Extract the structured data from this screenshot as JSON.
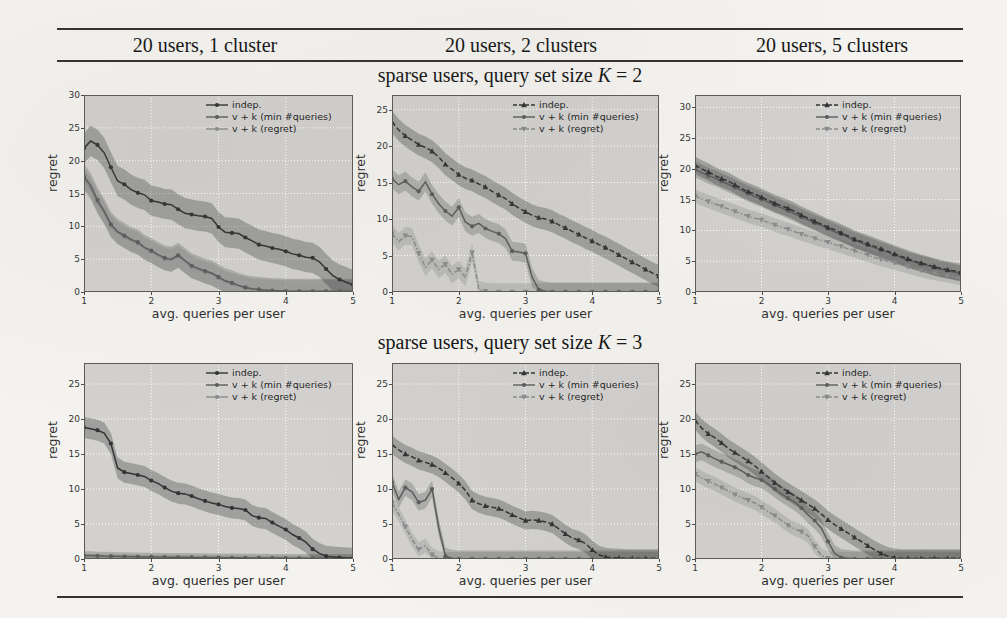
{
  "table": {
    "col_headers": [
      "20 users, 1 cluster",
      "20 users, 2 clusters",
      "20 users, 5 clusters"
    ],
    "row_titles": [
      "sparse users, query set size K = 2",
      "sparse users, query set size K = 3"
    ]
  },
  "axis": {
    "xlabel": "avg. queries per user",
    "ylabel": "regret",
    "xticks": [
      1,
      2,
      3,
      4,
      5
    ],
    "xlim": [
      1,
      5
    ]
  },
  "legend_labels": [
    "indep.",
    "v + k (min #queries)",
    "v + k (regret)"
  ],
  "colors": {
    "page_bg": "#f4f3ef",
    "rule": "#33322f",
    "plot_bg": "#d2d1cf",
    "grid": "#ffffff",
    "spine": "#5c5b58",
    "indep": "#343434",
    "vk_min": "#5c5c5c",
    "vk_regret": "#8a8a8a",
    "band_opacity": 0.32
  },
  "chart_data": [
    {
      "type": "line",
      "col_header": "20 users, 1 cluster",
      "row_title": "sparse users, query set size K = 2",
      "xlabel": "avg. queries per user",
      "ylabel": "regret",
      "x_start": 1,
      "x_step": 0.1,
      "xlim": [
        1,
        5
      ],
      "ylim": [
        0,
        30
      ],
      "yticks": [
        0,
        5,
        10,
        15,
        20,
        25,
        30
      ],
      "legend_pos": "upper-right",
      "grid": true,
      "series": [
        {
          "name": "indep.",
          "key": "indep",
          "marker": "circle",
          "dash": "solid",
          "band": 2.3,
          "y": [
            21.9,
            23.0,
            22.4,
            21.2,
            19.0,
            16.9,
            16.4,
            15.6,
            15.1,
            14.8,
            13.9,
            13.7,
            13.4,
            13.3,
            12.6,
            12.0,
            11.8,
            11.6,
            11.5,
            11.2,
            9.9,
            9.1,
            9.0,
            8.9,
            8.3,
            7.8,
            7.2,
            7.0,
            6.7,
            6.5,
            6.2,
            5.8,
            5.6,
            5.3,
            5.2,
            4.6,
            3.5,
            2.5,
            1.9,
            1.5,
            1.1
          ]
        },
        {
          "name": "v + k (min #queries)",
          "key": "vk_min",
          "marker": "circle",
          "dash": "solid",
          "band": 1.9,
          "y": [
            17.6,
            16.2,
            14.0,
            12.3,
            10.3,
            9.2,
            8.6,
            8.0,
            7.6,
            6.8,
            6.3,
            5.7,
            5.2,
            5.0,
            5.6,
            4.8,
            4.0,
            3.6,
            3.2,
            2.9,
            2.3,
            1.7,
            1.4,
            1.0,
            0.7,
            0.5,
            0.4,
            0.3,
            0.2,
            0.2,
            0.1,
            0.1,
            0.1,
            0.1,
            0.1,
            0.1,
            0.1,
            0.1,
            0.1,
            0.1,
            0.1
          ]
        },
        {
          "name": "v + k (regret)",
          "key": "vk_regret",
          "marker": "circle",
          "dash": "solid",
          "band": 1.7,
          "y": [
            17.1,
            15.7,
            13.6,
            12.0,
            10.0,
            9.0,
            8.4,
            7.8,
            7.4,
            6.6,
            6.1,
            5.5,
            5.0,
            4.8,
            5.4,
            4.6,
            3.8,
            3.4,
            3.0,
            2.7,
            2.1,
            1.5,
            1.2,
            0.9,
            0.6,
            0.4,
            0.3,
            0.2,
            0.2,
            0.1,
            0.1,
            0.1,
            0.1,
            0.1,
            0.1,
            0.1,
            0.1,
            0.1,
            0.1,
            0.1,
            0.1
          ]
        }
      ]
    },
    {
      "type": "line",
      "col_header": "20 users, 2 clusters",
      "row_title": "sparse users, query set size K = 2",
      "xlabel": "avg. queries per user",
      "ylabel": "regret",
      "x_start": 1,
      "x_step": 0.1,
      "xlim": [
        1,
        5
      ],
      "ylim": [
        0,
        27
      ],
      "yticks": [
        0,
        5,
        10,
        15,
        20,
        25
      ],
      "legend_pos": "upper-right",
      "grid": true,
      "series": [
        {
          "name": "indep.",
          "key": "indep",
          "marker": "triangle",
          "dash": "dashed",
          "band": 1.5,
          "y": [
            23.3,
            22.2,
            21.4,
            20.8,
            20.2,
            19.8,
            19.3,
            18.5,
            17.5,
            16.8,
            16.1,
            15.6,
            15.3,
            14.8,
            14.4,
            13.8,
            13.3,
            12.8,
            12.1,
            11.5,
            11.0,
            10.5,
            10.2,
            10.0,
            9.7,
            9.2,
            8.8,
            8.3,
            7.9,
            7.4,
            7.0,
            6.5,
            6.1,
            5.6,
            5.1,
            4.6,
            4.1,
            3.6,
            3.1,
            2.6,
            2.2
          ]
        },
        {
          "name": "v + k (min #queries)",
          "key": "vk_min",
          "marker": "circle",
          "dash": "solid",
          "band": 1.3,
          "y": [
            15.5,
            14.7,
            15.2,
            14.4,
            13.8,
            15.1,
            13.4,
            12.1,
            11.1,
            10.4,
            11.6,
            9.6,
            9.0,
            9.4,
            8.7,
            8.3,
            8.0,
            7.3,
            5.6,
            5.5,
            5.3,
            2.0,
            0.3,
            0.1,
            0,
            0,
            0,
            0,
            0,
            0,
            0,
            0,
            0,
            0,
            0,
            0,
            0,
            0,
            0,
            0,
            0
          ]
        },
        {
          "name": "v + k (regret)",
          "key": "vk_regret",
          "marker": "triangle-down",
          "dash": "dashdot",
          "band": 1.2,
          "y": [
            8.0,
            6.9,
            7.7,
            7.6,
            5.3,
            3.4,
            4.4,
            3.1,
            3.8,
            2.4,
            3.1,
            2.0,
            5.4,
            0.3,
            0.1,
            0,
            0,
            0,
            0,
            0,
            0,
            0,
            0,
            0,
            0,
            0,
            0,
            0,
            0,
            0,
            0,
            0,
            0,
            0,
            0,
            0,
            0,
            0,
            0,
            0,
            0
          ]
        }
      ]
    },
    {
      "type": "line",
      "col_header": "20 users, 5 clusters",
      "row_title": "sparse users, query set size K = 2",
      "xlabel": "avg. queries per user",
      "ylabel": "regret",
      "x_start": 1,
      "x_step": 0.1,
      "xlim": [
        1,
        5
      ],
      "ylim": [
        0,
        32
      ],
      "yticks": [
        0,
        5,
        10,
        15,
        20,
        25,
        30
      ],
      "legend_pos": "upper-right",
      "grid": true,
      "series": [
        {
          "name": "indep.",
          "key": "indep",
          "marker": "triangle",
          "dash": "dashed",
          "band": 1.4,
          "y": [
            20.6,
            20.0,
            19.5,
            18.9,
            18.4,
            18.0,
            17.4,
            16.8,
            16.3,
            15.9,
            15.4,
            14.9,
            14.4,
            14.0,
            13.6,
            13.1,
            12.5,
            12.0,
            11.5,
            11.0,
            10.5,
            10.1,
            9.6,
            9.1,
            8.6,
            8.2,
            7.8,
            7.4,
            7.0,
            6.6,
            6.2,
            5.8,
            5.4,
            5.0,
            4.7,
            4.4,
            4.1,
            3.8,
            3.6,
            3.4,
            3.2
          ]
        },
        {
          "name": "v + k (min #queries)",
          "key": "vk_min",
          "marker": "circle",
          "dash": "solid",
          "band": 1.3,
          "y": [
            19.9,
            19.4,
            18.9,
            18.5,
            18.0,
            17.5,
            17.0,
            16.5,
            16.0,
            15.5,
            15.1,
            14.6,
            14.1,
            13.7,
            13.2,
            12.7,
            12.2,
            11.7,
            11.2,
            10.8,
            10.3,
            9.8,
            9.4,
            8.9,
            8.4,
            8.0,
            7.6,
            7.2,
            6.8,
            6.4,
            6.0,
            5.6,
            5.2,
            4.9,
            4.6,
            4.3,
            4.0,
            3.7,
            3.5,
            3.2,
            3.0
          ]
        },
        {
          "name": "v + k (regret)",
          "key": "vk_regret",
          "marker": "triangle-down",
          "dash": "dashdot",
          "band": 1.1,
          "y": [
            15.6,
            15.1,
            14.7,
            14.3,
            13.9,
            13.5,
            13.1,
            12.7,
            12.3,
            12.0,
            11.7,
            11.3,
            10.9,
            10.5,
            10.2,
            9.8,
            9.4,
            9.1,
            8.7,
            8.4,
            8.1,
            7.7,
            7.4,
            7.0,
            6.7,
            6.3,
            6.0,
            5.6,
            5.3,
            5.0,
            4.7,
            4.4,
            4.1,
            3.8,
            3.5,
            3.2,
            3.0,
            2.8,
            2.6,
            2.4,
            2.2
          ]
        }
      ]
    },
    {
      "type": "line",
      "col_header": "20 users, 1 cluster",
      "row_title": "sparse users, query set size K = 3",
      "xlabel": "avg. queries per user",
      "ylabel": "regret",
      "x_start": 1,
      "x_step": 0.1,
      "xlim": [
        1,
        5
      ],
      "ylim": [
        0,
        28
      ],
      "yticks": [
        0,
        5,
        10,
        15,
        20,
        25
      ],
      "legend_pos": "upper-right",
      "grid": true,
      "series": [
        {
          "name": "indep.",
          "key": "indep",
          "marker": "circle",
          "dash": "solid",
          "band": 1.5,
          "y": [
            18.8,
            18.6,
            18.4,
            18.0,
            16.5,
            13.0,
            12.4,
            12.2,
            12.0,
            11.8,
            11.2,
            10.8,
            10.2,
            9.7,
            9.4,
            9.3,
            9.0,
            8.6,
            8.3,
            8.0,
            7.8,
            7.5,
            7.3,
            7.2,
            7.0,
            6.2,
            5.9,
            5.8,
            5.2,
            4.7,
            4.2,
            3.5,
            3.0,
            2.4,
            1.4,
            0.8,
            0.4,
            0.3,
            0.2,
            0.15,
            0.1
          ]
        },
        {
          "name": "v + k (min #queries)",
          "key": "vk_min",
          "marker": "circle",
          "dash": "solid",
          "band": 0.6,
          "y": [
            0.5,
            0.5,
            0.45,
            0.42,
            0.4,
            0.38,
            0.36,
            0.34,
            0.32,
            0.3,
            0.3,
            0.28,
            0.27,
            0.26,
            0.25,
            0.24,
            0.23,
            0.22,
            0.21,
            0.2,
            0.2,
            0.19,
            0.18,
            0.17,
            0.16,
            0.15,
            0.15,
            0.14,
            0.13,
            0.13,
            0.12,
            0.12,
            0.11,
            0.11,
            0.1,
            0.1,
            0.1,
            0.1,
            0.1,
            0.1,
            0.1
          ]
        },
        {
          "name": "v + k (regret)",
          "key": "vk_regret",
          "marker": "circle",
          "dash": "solid",
          "band": 0.4,
          "y": [
            0.3,
            0.3,
            0.28,
            0.27,
            0.26,
            0.25,
            0.24,
            0.23,
            0.22,
            0.21,
            0.2,
            0.2,
            0.19,
            0.18,
            0.17,
            0.16,
            0.15,
            0.15,
            0.14,
            0.13,
            0.13,
            0.12,
            0.12,
            0.11,
            0.11,
            0.1,
            0.1,
            0.1,
            0.09,
            0.09,
            0.08,
            0.08,
            0.08,
            0.07,
            0.07,
            0.07,
            0.06,
            0.06,
            0.06,
            0.05,
            0.05
          ]
        }
      ]
    },
    {
      "type": "line",
      "col_header": "20 users, 2 clusters",
      "row_title": "sparse users, query set size K = 3",
      "xlabel": "avg. queries per user",
      "ylabel": "regret",
      "x_start": 1,
      "x_step": 0.1,
      "xlim": [
        1,
        5
      ],
      "ylim": [
        0,
        28
      ],
      "yticks": [
        0,
        5,
        10,
        15,
        20,
        25
      ],
      "legend_pos": "upper-right",
      "grid": true,
      "series": [
        {
          "name": "indep.",
          "key": "indep",
          "marker": "triangle",
          "dash": "dashed",
          "band": 1.3,
          "y": [
            16.3,
            15.6,
            15.0,
            14.6,
            14.1,
            13.8,
            13.5,
            13.0,
            12.3,
            11.6,
            10.8,
            9.8,
            8.4,
            7.9,
            7.6,
            7.4,
            7.2,
            6.8,
            6.3,
            5.9,
            5.5,
            5.6,
            5.5,
            5.3,
            5.0,
            4.3,
            3.6,
            3.0,
            2.7,
            2.2,
            1.3,
            0.6,
            0.3,
            0.2,
            0.15,
            0.1,
            0.1,
            0.1,
            0.1,
            0.1,
            0.1
          ]
        },
        {
          "name": "v + k (min #queries)",
          "key": "vk_min",
          "marker": "circle",
          "dash": "solid",
          "band": 1.2,
          "y": [
            11.0,
            8.5,
            10.2,
            9.6,
            8.1,
            8.4,
            10.0,
            4.5,
            0.4,
            0.1,
            0,
            0,
            0,
            0,
            0,
            0,
            0,
            0,
            0,
            0,
            0,
            0,
            0,
            0,
            0,
            0,
            0,
            0,
            0,
            0,
            0,
            0,
            0,
            0,
            0,
            0,
            0,
            0,
            0,
            0,
            0
          ]
        },
        {
          "name": "v + k (regret)",
          "key": "vk_regret",
          "marker": "triangle-down",
          "dash": "dashdot",
          "band": 1.0,
          "y": [
            8.0,
            6.4,
            4.6,
            2.8,
            1.4,
            1.9,
            0.6,
            0.1,
            0,
            0,
            0,
            0,
            0,
            0,
            0,
            0,
            0,
            0,
            0,
            0,
            0,
            0,
            0,
            0,
            0,
            0,
            0,
            0,
            0,
            0,
            0,
            0,
            0,
            0,
            0,
            0,
            0,
            0,
            0,
            0,
            0
          ]
        }
      ]
    },
    {
      "type": "line",
      "col_header": "20 users, 5 clusters",
      "row_title": "sparse users, query set size K = 3",
      "xlabel": "avg. queries per user",
      "ylabel": "regret",
      "x_start": 1,
      "x_step": 0.1,
      "xlim": [
        1,
        5
      ],
      "ylim": [
        0,
        28
      ],
      "yticks": [
        0,
        5,
        10,
        15,
        20,
        25
      ],
      "legend_pos": "upper-right",
      "grid": true,
      "series": [
        {
          "name": "indep.",
          "key": "indep",
          "marker": "triangle",
          "dash": "dashed",
          "band": 1.3,
          "y": [
            19.8,
            18.7,
            17.9,
            17.3,
            16.6,
            15.8,
            15.2,
            14.6,
            14.0,
            13.3,
            12.5,
            11.7,
            10.9,
            10.2,
            9.6,
            9.0,
            8.4,
            7.8,
            7.2,
            6.4,
            5.6,
            4.9,
            4.3,
            3.7,
            3.1,
            2.5,
            1.9,
            1.3,
            0.8,
            0.4,
            0.2,
            0.1,
            0.1,
            0.1,
            0.1,
            0.1,
            0.1,
            0.1,
            0.1,
            0.1,
            0.1
          ]
        },
        {
          "name": "v + k (min #queries)",
          "key": "vk_min",
          "marker": "circle",
          "dash": "solid",
          "band": 1.2,
          "y": [
            15.0,
            15.3,
            14.8,
            14.3,
            13.9,
            13.5,
            13.1,
            12.6,
            12.0,
            11.6,
            11.3,
            10.7,
            10.0,
            9.3,
            8.7,
            8.1,
            7.3,
            6.3,
            5.5,
            4.4,
            2.5,
            0.8,
            0.2,
            0.1,
            0,
            0,
            0,
            0,
            0,
            0,
            0,
            0,
            0,
            0,
            0,
            0,
            0,
            0,
            0,
            0,
            0
          ]
        },
        {
          "name": "v + k (regret)",
          "key": "vk_regret",
          "marker": "triangle-down",
          "dash": "dashdot",
          "band": 1.0,
          "y": [
            12.1,
            11.6,
            11.1,
            10.7,
            10.2,
            9.7,
            9.2,
            8.8,
            8.4,
            8.0,
            7.4,
            6.8,
            6.2,
            5.5,
            4.8,
            4.3,
            3.9,
            3.3,
            1.8,
            0.5,
            0.1,
            0.1,
            0,
            0,
            0,
            0,
            0,
            0,
            0,
            0,
            0,
            0,
            0,
            0,
            0,
            0,
            0,
            0,
            0,
            0,
            0
          ]
        }
      ]
    }
  ]
}
